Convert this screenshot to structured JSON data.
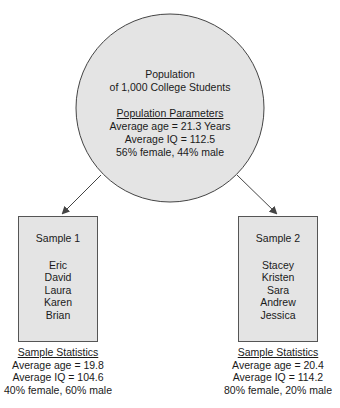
{
  "population": {
    "title_line1": "Population",
    "title_line2": "of 1,000 College Students",
    "parameters_heading": "Population Parameters",
    "avg_age": "Average age = 21.3 Years",
    "avg_iq": "Average IQ = 112.5",
    "gender": "56% female, 44% male"
  },
  "samples": [
    {
      "title": "Sample 1",
      "members": [
        "Eric",
        "David",
        "Laura",
        "Karen",
        "Brian"
      ],
      "stats_heading": "Sample Statistics",
      "avg_age": "Average age = 19.8",
      "avg_iq": "Average IQ = 104.6",
      "gender": "40% female, 60% male"
    },
    {
      "title": "Sample 2",
      "members": [
        "Stacey",
        "Kristen",
        "Sara",
        "Andrew",
        "Jessica"
      ],
      "stats_heading": "Sample Statistics",
      "avg_age": "Average age = 20.4",
      "avg_iq": "Average IQ = 114.2",
      "gender": "80% female, 20% male"
    }
  ],
  "colors": {
    "fill": "#e4e4e4",
    "stroke": "#555555"
  }
}
